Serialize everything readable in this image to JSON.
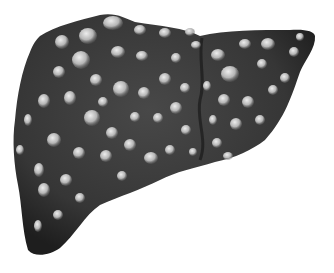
{
  "image": {
    "subject": "Cirrhotic liver illustration",
    "description": "Dark grey liver covered in pale rounded nodules",
    "background": "#ffffff",
    "colors": {
      "liver_base": "#3a3a3a",
      "liver_dark": "#1f1f1f",
      "nodule_light": "#e6e6e6",
      "nodule_mid": "#9a9a9a"
    }
  },
  "nodules": [
    [
      113,
      23,
      10,
      7
    ],
    [
      88,
      36,
      9,
      8
    ],
    [
      62,
      42,
      7,
      7
    ],
    [
      140,
      30,
      6,
      5
    ],
    [
      165,
      33,
      6,
      5
    ],
    [
      190,
      32,
      5,
      4
    ],
    [
      81,
      60,
      9,
      9
    ],
    [
      59,
      72,
      6,
      6
    ],
    [
      118,
      52,
      7,
      6
    ],
    [
      142,
      56,
      6,
      5
    ],
    [
      176,
      58,
      5,
      5
    ],
    [
      196,
      45,
      5,
      4
    ],
    [
      121,
      89,
      8,
      8
    ],
    [
      96,
      80,
      6,
      6
    ],
    [
      144,
      93,
      6,
      6
    ],
    [
      165,
      79,
      6,
      6
    ],
    [
      185,
      88,
      5,
      5
    ],
    [
      70,
      98,
      6,
      7
    ],
    [
      44,
      101,
      6,
      7
    ],
    [
      92,
      118,
      8,
      8
    ],
    [
      54,
      140,
      7,
      7
    ],
    [
      79,
      153,
      6,
      6
    ],
    [
      112,
      133,
      6,
      6
    ],
    [
      135,
      117,
      5,
      5
    ],
    [
      158,
      118,
      5,
      5
    ],
    [
      176,
      108,
      6,
      6
    ],
    [
      186,
      130,
      5,
      5
    ],
    [
      151,
      158,
      7,
      6
    ],
    [
      130,
      145,
      6,
      6
    ],
    [
      106,
      156,
      6,
      6
    ],
    [
      39,
      170,
      5,
      7
    ],
    [
      66,
      180,
      6,
      6
    ],
    [
      44,
      190,
      6,
      7
    ],
    [
      80,
      198,
      5,
      5
    ],
    [
      38,
      226,
      4,
      6
    ],
    [
      58,
      215,
      5,
      5
    ],
    [
      122,
      176,
      5,
      5
    ],
    [
      170,
      150,
      5,
      5
    ],
    [
      193,
      152,
      4,
      4
    ],
    [
      28,
      120,
      4,
      6
    ],
    [
      20,
      150,
      4,
      5
    ],
    [
      103,
      102,
      5,
      5
    ],
    [
      218,
      55,
      7,
      6
    ],
    [
      245,
      44,
      6,
      5
    ],
    [
      268,
      44,
      7,
      6
    ],
    [
      294,
      52,
      5,
      5
    ],
    [
      230,
      74,
      9,
      8
    ],
    [
      262,
      64,
      5,
      5
    ],
    [
      285,
      78,
      5,
      5
    ],
    [
      224,
      100,
      6,
      6
    ],
    [
      248,
      102,
      6,
      6
    ],
    [
      273,
      90,
      5,
      5
    ],
    [
      236,
      124,
      6,
      6
    ],
    [
      260,
      120,
      5,
      5
    ],
    [
      217,
      143,
      5,
      5
    ],
    [
      228,
      156,
      5,
      4
    ],
    [
      300,
      37,
      4,
      4
    ],
    [
      207,
      86,
      4,
      5
    ],
    [
      213,
      120,
      4,
      5
    ]
  ]
}
